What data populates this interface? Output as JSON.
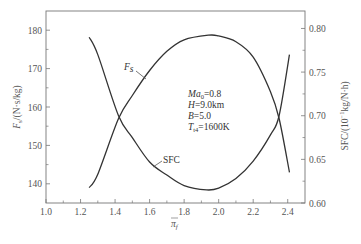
{
  "chart_data": {
    "type": "line",
    "title": "",
    "xlabel": "π_f",
    "ylabel_left": "F_s/(N·s/kg)",
    "ylabel_right": "SFC/(10⁻¹kg/N·h)",
    "xlim": [
      1.0,
      2.5
    ],
    "ylim_left": [
      135,
      185
    ],
    "ylim_right": [
      0.6,
      0.82
    ],
    "x_ticks": [
      "1.0",
      "1.2",
      "1.4",
      "1.6",
      "1.8",
      "2.0",
      "2.2",
      "2.4"
    ],
    "y_ticks_left": [
      "140",
      "150",
      "160",
      "170",
      "180"
    ],
    "y_ticks_right": [
      "0.60",
      "0.65",
      "0.70",
      "0.75",
      "0.80"
    ],
    "grid": false,
    "series": [
      {
        "name": "Fs",
        "axis": "left",
        "x": [
          1.25,
          1.3,
          1.42,
          1.5,
          1.6,
          1.7,
          1.8,
          1.94,
          2.0,
          2.1,
          2.2,
          2.3,
          2.35,
          2.41
        ],
        "values": [
          139,
          142.5,
          157,
          163,
          169.5,
          174.5,
          177.5,
          178.7,
          178.5,
          177,
          173,
          164,
          157,
          143
        ]
      },
      {
        "name": "SFC",
        "axis": "right",
        "x": [
          1.25,
          1.3,
          1.42,
          1.5,
          1.6,
          1.7,
          1.8,
          1.93,
          2.0,
          2.1,
          2.2,
          2.3,
          2.35,
          2.41
        ],
        "values": [
          0.79,
          0.77,
          0.7,
          0.675,
          0.647,
          0.632,
          0.62,
          0.615,
          0.617,
          0.628,
          0.648,
          0.678,
          0.7,
          0.77
        ]
      }
    ],
    "annotations": {
      "curve_labels": {
        "fs": "F",
        "fs_sub": "s",
        "sfc": "SFC"
      },
      "conditions": [
        {
          "var": "Ma",
          "sub": "0",
          "value": "=0.8"
        },
        {
          "var": "H",
          "sub": "",
          "value": "=9.0km"
        },
        {
          "var": "B",
          "sub": "",
          "value": "=5.0"
        },
        {
          "var": "T",
          "sub": "t4",
          "value": "=1600K"
        }
      ]
    }
  },
  "labels": {
    "xlabel_main": "π",
    "xlabel_sub": "f",
    "ylabel_left_main": "F",
    "ylabel_left_sub": "s",
    "ylabel_left_unit": "/(N·s/kg)",
    "ylabel_right": "SFC/(10",
    "ylabel_right_sup": "−1",
    "ylabel_right_unit": "kg/N·h)"
  }
}
